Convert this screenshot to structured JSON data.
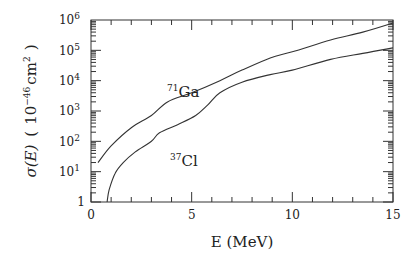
{
  "chart_data": {
    "type": "line",
    "title": "",
    "xlabel": "E (MeV)",
    "ylabel": "σ(E) ( 10^-46 cm^2 )",
    "xscale": "linear",
    "yscale": "log",
    "xlim": [
      0,
      15
    ],
    "ylim": [
      1,
      1000000
    ],
    "x_ticks": [
      0,
      5,
      10,
      15
    ],
    "y_ticks": [
      "1",
      "10^1",
      "10^2",
      "10^3",
      "10^4",
      "10^5",
      "10^6"
    ],
    "grid": false,
    "legend": "none (inline curve labels)",
    "series": [
      {
        "name": "71Ga",
        "x": [
          0.35,
          1.0,
          2.0,
          3.0,
          3.8,
          5.0,
          6.4,
          7.5,
          8.9,
          10.0,
          11.9,
          13.5,
          15.0
        ],
        "log10y": [
          1.3,
          1.85,
          2.45,
          2.85,
          3.3,
          3.6,
          4.0,
          4.35,
          4.75,
          4.95,
          5.34,
          5.6,
          5.9
        ]
      },
      {
        "name": "37Cl",
        "x": [
          0.8,
          0.9,
          1.2,
          1.6,
          2.2,
          3.0,
          3.4,
          4.3,
          5.2,
          5.8,
          6.4,
          7.5,
          8.9,
          10.0,
          11.9,
          13.5,
          15.0
        ],
        "log10y": [
          0.0,
          0.4,
          0.95,
          1.3,
          1.65,
          2.0,
          2.28,
          2.55,
          2.85,
          3.2,
          3.6,
          3.95,
          4.2,
          4.35,
          4.7,
          4.9,
          5.08
        ]
      }
    ],
    "annotations": [
      {
        "text": "71Ga",
        "x": 4.0,
        "log10y": 3.75
      },
      {
        "text": "37Cl",
        "x": 4.0,
        "log10y": 1.45
      }
    ]
  },
  "labels": {
    "xlabel": "E (MeV)",
    "ylabel_main": "σ(E)",
    "ylabel_paren_open": "(",
    "ylabel_base": "10",
    "ylabel_exp": "−46",
    "ylabel_unit": "cm",
    "ylabel_unit_exp": "2",
    "ylabel_paren_close": ")",
    "ga_mass": "71",
    "ga_sym": "Ga",
    "cl_mass": "37",
    "cl_sym": "Cl",
    "x_ticks": [
      "0",
      "5",
      "10",
      "15"
    ],
    "y_one": "1",
    "y_base": "10",
    "y_exps": [
      "1",
      "2",
      "3",
      "4",
      "5",
      "6"
    ]
  }
}
